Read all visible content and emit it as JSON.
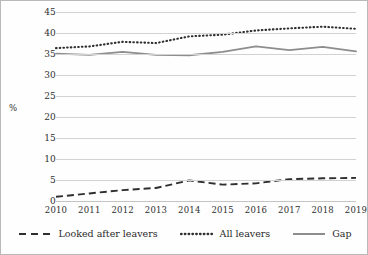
{
  "chart_data": {
    "type": "line",
    "title": "",
    "xlabel": "",
    "ylabel": "%",
    "categories": [
      "2010",
      "2011",
      "2012",
      "2013",
      "2014",
      "2015",
      "2016",
      "2017",
      "2018",
      "2019"
    ],
    "ylim": [
      0,
      45
    ],
    "ytick_values": [
      0,
      5,
      10,
      15,
      20,
      25,
      30,
      35,
      40,
      45
    ],
    "ytick_labels": [
      "0",
      "5",
      "10",
      "15",
      "20",
      "25",
      "30",
      "35",
      "40",
      "45"
    ],
    "grid": true,
    "legend_position": "bottom",
    "series": [
      {
        "name": "Looked after leavers",
        "style": "dashed",
        "color": "#2f2f2f",
        "values": [
          1.0,
          1.8,
          2.6,
          3.1,
          4.9,
          3.9,
          4.2,
          5.2,
          5.4,
          5.5
        ]
      },
      {
        "name": "All leavers",
        "style": "dotted",
        "color": "#2f2f2f",
        "values": [
          36.4,
          36.8,
          37.9,
          37.6,
          39.2,
          39.6,
          40.6,
          41.1,
          41.5,
          41.0
        ]
      },
      {
        "name": "Gap",
        "style": "solid",
        "color": "#8d8d8d",
        "values": [
          35.1,
          34.8,
          35.5,
          34.8,
          34.7,
          35.5,
          36.8,
          35.9,
          36.7,
          35.6
        ]
      }
    ]
  },
  "axis": {
    "y_title": "%"
  },
  "legend": {
    "items": [
      {
        "label": "Looked after leavers"
      },
      {
        "label": "All leavers"
      },
      {
        "label": "Gap"
      }
    ]
  }
}
